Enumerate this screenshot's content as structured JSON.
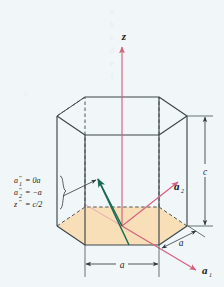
{
  "figure": {
    "background_color": "#f1f6f8",
    "axes": {
      "z_label": "z",
      "a1_label": "a",
      "a1_sub": "1",
      "a2_label": "a",
      "a2_sub": "2",
      "axis_color": "#d4607f"
    },
    "dimensions": {
      "height_label": "c",
      "edge_label": "a",
      "bottom_label": "a",
      "line_color": "#2e3a40"
    },
    "point_coordinates": {
      "line1_var": "a",
      "line1_prime": "″",
      "line1_sub": "1",
      "line1_value": "= 0a",
      "line2_var": "a",
      "line2_prime": "″",
      "line2_sub": "2",
      "line2_value": "= −a",
      "line3_var": "z",
      "line3_prime": "″",
      "line3_value": "= c/2",
      "brace": "}"
    },
    "vector": {
      "color": "#1c6b52",
      "description": "direction vector from cell center to midpoint of side face edge"
    },
    "cell": {
      "face_fill": "#f8dfb8",
      "edge_color": "#3c464c",
      "hidden_edge_style": "dashed"
    },
    "watermark": {
      "chars": [
        "a",
        "b",
        "c",
        "d",
        "e",
        "f"
      ]
    }
  }
}
